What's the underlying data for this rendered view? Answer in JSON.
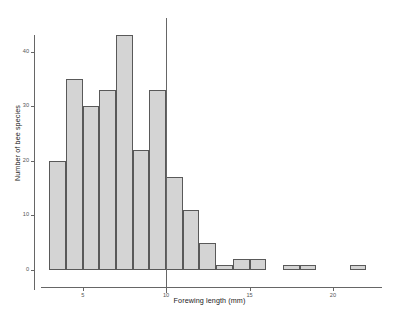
{
  "chart_data": {
    "type": "bar",
    "title": "",
    "subtitle": "",
    "xlabel": "Forewing length (mm)",
    "ylabel": "Number of bee species",
    "grid": false,
    "legend": "none",
    "xlim": [
      2.5,
      22.7
    ],
    "ylim": [
      0,
      44
    ],
    "x_ticks": [
      5,
      10,
      15,
      20
    ],
    "x_tick_labels": [
      "5",
      "10",
      "15",
      "20"
    ],
    "y_ticks": [
      0,
      10,
      20,
      30,
      40
    ],
    "y_tick_labels": [
      "0",
      "10",
      "20",
      "30",
      "40"
    ],
    "bin_width": 1,
    "bin_starts": [
      3,
      4,
      5,
      6,
      7,
      8,
      9,
      10,
      11,
      12,
      13,
      14,
      15,
      16,
      17,
      18,
      19,
      20,
      21,
      22
    ],
    "categories": [
      "3-4",
      "4-5",
      "5-6",
      "6-7",
      "7-8",
      "8-9",
      "9-10",
      "10-11",
      "11-12",
      "12-13",
      "13-14",
      "14-15",
      "15-16",
      "16-17",
      "17-18",
      "18-19",
      "19-20",
      "20-21",
      "21-22",
      "22-23"
    ],
    "values": [
      20,
      35,
      30,
      33,
      43,
      22,
      33,
      17,
      11,
      5,
      1,
      2,
      2,
      0,
      1,
      1,
      0,
      0,
      1,
      0
    ],
    "annotations": [
      {
        "type": "vertical-line",
        "x": 10,
        "label": ""
      }
    ],
    "bar_fill_color": "#d4d4d4",
    "bar_edge_color": "#595959",
    "axis_color": "#666666",
    "reference_line_color": "#666666",
    "background_color": "#ffffff"
  }
}
